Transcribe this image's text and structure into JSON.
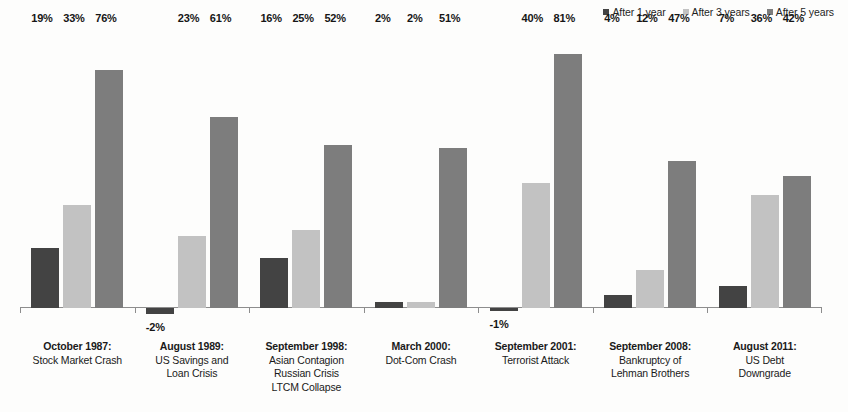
{
  "chart_data": {
    "type": "bar",
    "title": "",
    "subtitle": "",
    "xlabel": "",
    "ylabel": "",
    "grid": false,
    "legend_position": "top-right",
    "ylim": [
      -5,
      85
    ],
    "categories": [
      "October 1987: Stock Market Crash",
      "August 1989: US Savings and Loan Crisis",
      "September 1998: Asian Contagion Russian Crisis LTCM Collapse",
      "March 2000: Dot-Com Crash",
      "September 2001: Terrorist Attack",
      "September 2008: Bankruptcy of Lehman Brothers",
      "August 2011: US Debt Downgrade"
    ],
    "series": [
      {
        "name": "After 1 year",
        "color": "#434343",
        "values": [
          19,
          -2,
          16,
          2,
          -1,
          4,
          7
        ]
      },
      {
        "name": "After 3 years",
        "color": "#c2c2c2",
        "values": [
          33,
          23,
          25,
          2,
          40,
          12,
          36
        ]
      },
      {
        "name": "After 5 years",
        "color": "#7d7d7d",
        "values": [
          76,
          61,
          52,
          51,
          81,
          47,
          42
        ]
      }
    ],
    "value_labels": [
      [
        "19%",
        "-2%",
        "16%",
        "2%",
        "-1%",
        "4%",
        "7%"
      ],
      [
        "33%",
        "23%",
        "25%",
        "2%",
        "40%",
        "12%",
        "36%"
      ],
      [
        "76%",
        "61%",
        "52%",
        "51%",
        "81%",
        "47%",
        "42%"
      ]
    ]
  },
  "legend": {
    "items": [
      {
        "label": "After 1 year",
        "color": "#434343"
      },
      {
        "label": "After 3 years",
        "color": "#c2c2c2"
      },
      {
        "label": "After 5 years",
        "color": "#7d7d7d"
      }
    ]
  },
  "categories_display": [
    {
      "title": "October 1987:",
      "lines": [
        "Stock Market Crash"
      ]
    },
    {
      "title": "August 1989:",
      "lines": [
        "US Savings and",
        "Loan Crisis"
      ]
    },
    {
      "title": "September 1998:",
      "lines": [
        "Asian Contagion",
        "Russian Crisis",
        "LTCM Collapse"
      ]
    },
    {
      "title": "March 2000:",
      "lines": [
        "Dot-Com Crash"
      ]
    },
    {
      "title": "September 2001:",
      "lines": [
        "Terrorist Attack"
      ]
    },
    {
      "title": "September 2008:",
      "lines": [
        "Bankruptcy of",
        "Lehman Brothers"
      ]
    },
    {
      "title": "August 2011:",
      "lines": [
        "US Debt",
        "Downgrade"
      ]
    }
  ],
  "axis": {
    "baseline_value": "0"
  }
}
